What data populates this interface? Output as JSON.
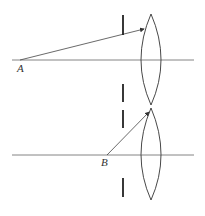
{
  "diagrams": [
    {
      "id": "top",
      "point_label": "A",
      "axis": {
        "x1": 12,
        "x2": 194,
        "y": 60
      },
      "point": {
        "x": 20,
        "y": 60
      },
      "ray_end": {
        "x": 145,
        "y": 29
      },
      "aperture": {
        "x": 123,
        "top": [
          15,
          35
        ],
        "bottom": [
          84,
          102
        ]
      },
      "lens": {
        "cx": 151,
        "top": 14,
        "bottom": 105,
        "half_width": 10
      }
    },
    {
      "id": "bottom",
      "point_label": "B",
      "axis": {
        "x1": 12,
        "x2": 194,
        "y": 155
      },
      "point": {
        "x": 107,
        "y": 155
      },
      "ray_end": {
        "x": 150,
        "y": 111
      },
      "aperture": {
        "x": 123,
        "top": [
          110,
          128
        ],
        "bottom": [
          178,
          197
        ]
      },
      "lens": {
        "cx": 151,
        "top": 108,
        "bottom": 200,
        "half_width": 10
      }
    }
  ],
  "colors": {
    "line": "#555555",
    "lens": "#333333",
    "aperture": "#222222"
  }
}
